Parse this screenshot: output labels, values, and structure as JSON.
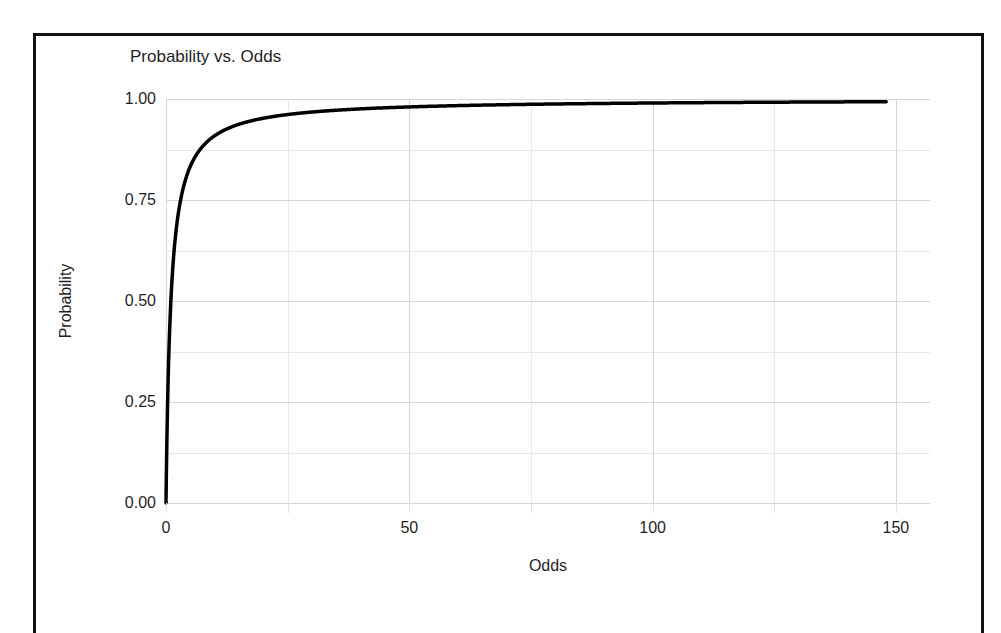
{
  "figure": {
    "background_color": "#ffffff",
    "frame_color": "#111111",
    "title": "Probability vs. Odds",
    "x_axis_title": "Odds",
    "y_axis_title": "Probability"
  },
  "chart_data": {
    "type": "line",
    "title": "Probability vs. Odds",
    "xlabel": "Odds",
    "ylabel": "Probability",
    "xlim": [
      0,
      157
    ],
    "ylim": [
      0.0,
      1.0
    ],
    "grid": true,
    "legend": "none",
    "line_color": "#000000",
    "line_width": 3.5,
    "relationship": "p = odds / (1 + odds)",
    "x_ticks": [
      0,
      50,
      100,
      150
    ],
    "x_tick_labels": [
      "0",
      "50",
      "100",
      "150"
    ],
    "x_minor_ticks": [
      25,
      75,
      125
    ],
    "y_ticks": [
      0.0,
      0.25,
      0.5,
      0.75,
      1.0
    ],
    "y_tick_labels": [
      "0.00",
      "0.25",
      "0.50",
      "0.75",
      "1.00"
    ],
    "y_minor_ticks": [
      0.125,
      0.375,
      0.625,
      0.875
    ],
    "series": [
      {
        "name": "Probability",
        "x": [
          0,
          0.25,
          0.5,
          0.75,
          1,
          1.5,
          2,
          2.5,
          3,
          4,
          5,
          6,
          7,
          8,
          9,
          10,
          12,
          14,
          16,
          18,
          20,
          25,
          30,
          35,
          40,
          50,
          60,
          70,
          80,
          90,
          100,
          110,
          120,
          130,
          140,
          148
        ],
        "y": [
          0.0,
          0.2,
          0.333,
          0.429,
          0.5,
          0.6,
          0.667,
          0.714,
          0.75,
          0.8,
          0.833,
          0.857,
          0.875,
          0.889,
          0.9,
          0.909,
          0.923,
          0.933,
          0.941,
          0.947,
          0.952,
          0.962,
          0.968,
          0.972,
          0.976,
          0.98,
          0.984,
          0.986,
          0.988,
          0.989,
          0.99,
          0.991,
          0.992,
          0.992,
          0.993,
          0.993
        ]
      }
    ]
  }
}
